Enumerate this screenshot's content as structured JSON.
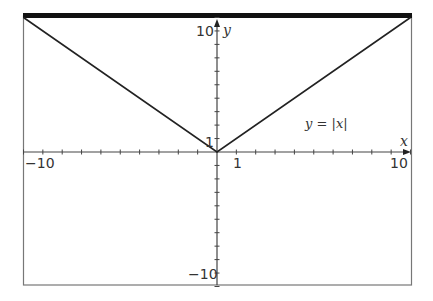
{
  "chart_data": {
    "type": "line",
    "title": "",
    "xlabel": "x",
    "ylabel": "y",
    "xlim": [
      -10,
      10
    ],
    "ylim": [
      -10,
      10
    ],
    "grid": false,
    "series": [
      {
        "name": "y = |x|",
        "x": [
          -10,
          0,
          10
        ],
        "y": [
          10,
          0,
          10
        ]
      }
    ],
    "annotations": [
      {
        "text": "y = |x|",
        "x": 5.2,
        "y": 2.5
      }
    ],
    "x_tick_labels": {
      "-10": "−10",
      "1": "1",
      "10": "10"
    },
    "y_tick_labels": {
      "10": "10",
      "1": "1",
      "-10": "−10"
    },
    "x_ticks": [
      -10,
      -9,
      -8,
      -7,
      -6,
      -5,
      -4,
      -3,
      -2,
      -1,
      1,
      2,
      3,
      4,
      5,
      6,
      7,
      8,
      9,
      10
    ],
    "y_ticks": [
      -10,
      -9,
      -8,
      -7,
      -6,
      -5,
      -4,
      -3,
      -2,
      -1,
      1,
      2,
      3,
      4,
      5,
      6,
      7,
      8,
      9,
      10
    ]
  },
  "labels": {
    "x_axis": "x",
    "y_axis": "y",
    "equation": "y = |x|",
    "x_min": "−10",
    "x_one": "1",
    "x_max": "10",
    "y_max": "10",
    "y_one": "1",
    "y_min": "−10"
  },
  "colors": {
    "line": "#222222",
    "axis": "#444444",
    "frame": "#666666",
    "top_bar": "#111111"
  }
}
